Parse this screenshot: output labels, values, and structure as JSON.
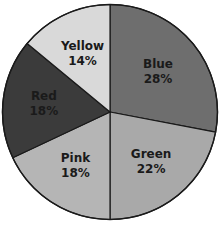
{
  "chart_data": {
    "type": "pie",
    "title": "",
    "start_angle_deg": 0,
    "direction": "clockwise",
    "categories": [
      "Blue",
      "Green",
      "Pink",
      "Red",
      "Yellow"
    ],
    "values": [
      28,
      22,
      18,
      18,
      14
    ],
    "unit": "%",
    "slices": [
      {
        "label": "Blue",
        "value": 28,
        "value_label": "28%",
        "fill": "#6e6e6e"
      },
      {
        "label": "Green",
        "value": 22,
        "value_label": "22%",
        "fill": "#a9a9a9"
      },
      {
        "label": "Pink",
        "value": 18,
        "value_label": "18%",
        "fill": "#b5b5b5"
      },
      {
        "label": "Red",
        "value": 18,
        "value_label": "18%",
        "fill": "#3b3b3b"
      },
      {
        "label": "Yellow",
        "value": 14,
        "value_label": "14%",
        "fill": "#d9d9d9"
      }
    ],
    "legend": "none (labels inside slices)",
    "stroke_color": "#1a1a1a"
  }
}
